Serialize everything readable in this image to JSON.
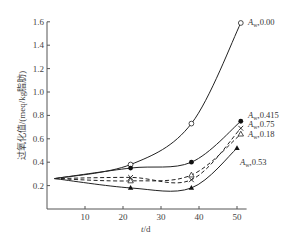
{
  "chart_data": {
    "type": "line",
    "title": "",
    "xlabel": "t/d",
    "ylabel": "过氧化值/(meq/kg脂肪)",
    "xlim": [
      0,
      52
    ],
    "ylim": [
      0,
      1.6
    ],
    "xticks": [
      10,
      20,
      30,
      40,
      50
    ],
    "yticks": [
      0.2,
      0.4,
      0.6,
      0.8,
      1.0,
      1.2,
      1.4,
      1.6
    ],
    "grid": false,
    "legend_position": "inline-right",
    "series": [
      {
        "name": "Aw 0.00",
        "label_prefix": "A",
        "label_sub": "w",
        "label_value": "0.00",
        "marker": "open-circle",
        "line": "solid",
        "x": [
          2,
          22,
          38,
          51
        ],
        "y": [
          0.26,
          0.38,
          0.73,
          1.59
        ]
      },
      {
        "name": "Aw 0.415",
        "label_prefix": "A",
        "label_sub": "w",
        "label_value": "0.415",
        "marker": "filled-circle",
        "line": "solid",
        "x": [
          2,
          22,
          38,
          51
        ],
        "y": [
          0.26,
          0.35,
          0.4,
          0.75
        ]
      },
      {
        "name": "Aw 0.75",
        "label_prefix": "A",
        "label_sub": "w",
        "label_value": "0.75",
        "marker": "cross",
        "line": "dashed",
        "x": [
          2,
          22,
          38,
          51
        ],
        "y": [
          0.26,
          0.27,
          0.25,
          0.69
        ]
      },
      {
        "name": "Aw 0.18",
        "label_prefix": "A",
        "label_sub": "w",
        "label_value": "0.18",
        "marker": "open-triangle",
        "line": "dashed",
        "x": [
          2,
          22,
          38,
          51
        ],
        "y": [
          0.26,
          0.24,
          0.29,
          0.64
        ]
      },
      {
        "name": "Aw 0.53",
        "label_prefix": "A",
        "label_sub": "w",
        "label_value": "0.53",
        "marker": "filled-triangle",
        "line": "solid",
        "x": [
          2,
          22,
          38,
          50
        ],
        "y": [
          0.26,
          0.18,
          0.18,
          0.52
        ]
      }
    ]
  }
}
